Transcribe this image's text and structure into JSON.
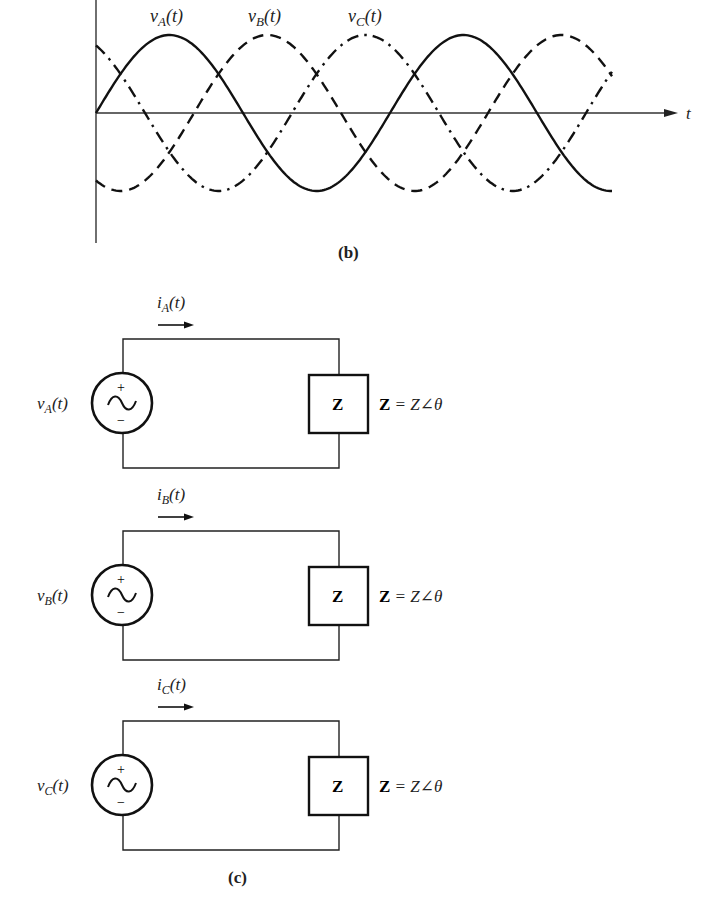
{
  "figure": {
    "waveform_panel": {
      "caption": "(b)",
      "axis_label_t": "t",
      "signals": [
        {
          "name": "vA",
          "label_base": "v",
          "label_sub": "A",
          "label_arg": "(t)",
          "style": "solid",
          "phase_deg": 0
        },
        {
          "name": "vB",
          "label_base": "v",
          "label_sub": "B",
          "label_arg": "(t)",
          "style": "dashed",
          "phase_deg": -120
        },
        {
          "name": "vC",
          "label_base": "v",
          "label_sub": "C",
          "label_arg": "(t)",
          "style": "dash-dot",
          "phase_deg": 120
        }
      ]
    },
    "circuit_panel": {
      "caption": "(c)",
      "circuits": [
        {
          "source_base": "v",
          "source_sub": "A",
          "source_arg": "(t)",
          "current_base": "i",
          "current_sub": "A",
          "current_arg": "(t)",
          "load_label": "Z",
          "impedance_eq_bold": "Z",
          "impedance_eq_rest": " = Z∠θ",
          "plus": "+",
          "minus": "−"
        },
        {
          "source_base": "v",
          "source_sub": "B",
          "source_arg": "(t)",
          "current_base": "i",
          "current_sub": "B",
          "current_arg": "(t)",
          "load_label": "Z",
          "impedance_eq_bold": "Z",
          "impedance_eq_rest": " = Z∠θ",
          "plus": "+",
          "minus": "−"
        },
        {
          "source_base": "v",
          "source_sub": "C",
          "source_arg": "(t)",
          "current_base": "i",
          "current_sub": "C",
          "current_arg": "(t)",
          "load_label": "Z",
          "impedance_eq_bold": "Z",
          "impedance_eq_rest": " = Z∠θ",
          "plus": "+",
          "minus": "−"
        }
      ]
    }
  }
}
